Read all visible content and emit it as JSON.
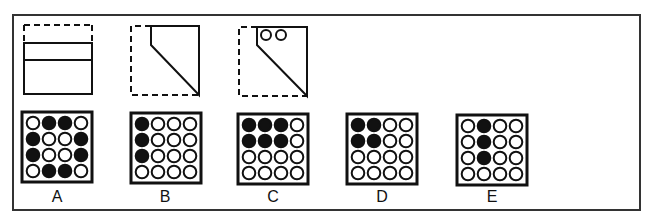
{
  "puzzle": {
    "type": "paper-folding-punch",
    "fold_steps": [
      {
        "id": "step-1",
        "description": "Square folded top edge down (dashed = original outline)"
      },
      {
        "id": "step-2",
        "description": "Folded corner diagonally (dashed = original outline)"
      },
      {
        "id": "step-3",
        "description": "Two holes punched near top",
        "holes": 2
      }
    ],
    "options": [
      {
        "label": "A",
        "grid": [
          [
            0,
            1,
            1,
            0
          ],
          [
            1,
            0,
            0,
            1
          ],
          [
            1,
            0,
            0,
            1
          ],
          [
            0,
            1,
            1,
            0
          ]
        ]
      },
      {
        "label": "B",
        "grid": [
          [
            1,
            0,
            0,
            0
          ],
          [
            1,
            0,
            0,
            0
          ],
          [
            1,
            0,
            0,
            0
          ],
          [
            0,
            0,
            0,
            0
          ]
        ]
      },
      {
        "label": "C",
        "grid": [
          [
            1,
            1,
            1,
            0
          ],
          [
            1,
            1,
            1,
            0
          ],
          [
            0,
            0,
            0,
            0
          ],
          [
            0,
            0,
            0,
            0
          ]
        ]
      },
      {
        "label": "D",
        "grid": [
          [
            1,
            1,
            0,
            0
          ],
          [
            1,
            1,
            0,
            0
          ],
          [
            0,
            0,
            0,
            0
          ],
          [
            0,
            0,
            0,
            0
          ]
        ]
      },
      {
        "label": "E",
        "grid": [
          [
            0,
            1,
            0,
            0
          ],
          [
            0,
            1,
            0,
            0
          ],
          [
            0,
            1,
            0,
            0
          ],
          [
            0,
            0,
            0,
            0
          ]
        ]
      }
    ]
  },
  "colors": {
    "stroke": "#111111",
    "frame": "#333333",
    "background": "#ffffff"
  }
}
